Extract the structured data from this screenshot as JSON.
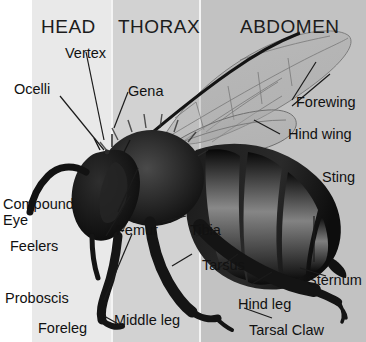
{
  "diagram": {
    "width": 366,
    "height": 342,
    "background": "#ffffff"
  },
  "regions": [
    {
      "id": "head",
      "title": "HEAD",
      "band_color": "#e9e9e9"
    },
    {
      "id": "thorax",
      "title": "THORAX",
      "band_color": "#d2d2d2"
    },
    {
      "id": "abdomen",
      "title": "ABDOMEN",
      "band_color": "#c2c2c2"
    }
  ],
  "labels": [
    {
      "id": "ocelli",
      "text": "Ocelli"
    },
    {
      "id": "vertex",
      "text": "Vertex"
    },
    {
      "id": "gena",
      "text": "Gena"
    },
    {
      "id": "forewing",
      "text": "Forewing"
    },
    {
      "id": "hind-wing",
      "text": "Hind wing"
    },
    {
      "id": "compound-eye",
      "text": "Compound Eye"
    },
    {
      "id": "sting",
      "text": "Sting"
    },
    {
      "id": "feelers",
      "text": "Feelers"
    },
    {
      "id": "femur",
      "text": "Femur"
    },
    {
      "id": "tibia",
      "text": "Tibia"
    },
    {
      "id": "tarsus",
      "text": "Tarsus"
    },
    {
      "id": "sternum",
      "text": "Sternum"
    },
    {
      "id": "proboscis",
      "text": "Proboscis"
    },
    {
      "id": "foreleg",
      "text": "Foreleg"
    },
    {
      "id": "middle-leg",
      "text": "Middle leg"
    },
    {
      "id": "hind-leg",
      "text": "Hind leg"
    },
    {
      "id": "tarsal-claw",
      "text": "Tarsal Claw"
    }
  ],
  "colors": {
    "body_dark": "#141414",
    "body_mid": "#3a3a3a",
    "wing": "#9a9a9a",
    "text": "#111111"
  }
}
